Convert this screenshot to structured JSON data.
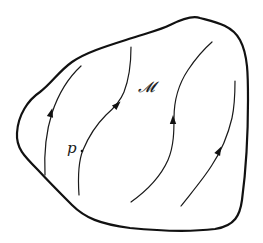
{
  "diagram": {
    "manifold_label": "𝓜",
    "point_label": "p",
    "colors": {
      "stroke": "#111111",
      "background": "#ffffff"
    },
    "outline": {
      "name": "manifold-boundary",
      "path": "M17,133 C18,115 28,100 40,92 C52,83 58,72 72,62 C86,52 110,45 132,38 C150,32 160,30 170,25 C180,20 192,15 200,18 C215,22 232,25 240,40 C248,55 248,75 248,100 C248,140 246,170 242,200 C240,215 235,226 215,229 C190,232 160,231 130,228 C100,224 85,218 72,205 C58,191 50,183 38,170 C24,156 16,148 17,133 Z"
    },
    "flow_curves": [
      {
        "name": "flow-curve-1",
        "path": "M45,175 C44,155 45,135 52,113 C58,95 68,78 81,66",
        "arrow": {
          "x": 51,
          "y": 113,
          "angle": -75
        }
      },
      {
        "name": "flow-curve-2",
        "path": "M79,195 C78,180 78,162 83,150 C88,138 96,125 106,115 C114,108 120,102 124,92 C129,79 131,62 131,47",
        "arrow": {
          "x": 117,
          "y": 105,
          "angle": -45
        },
        "point": {
          "x": 82,
          "y": 151
        }
      },
      {
        "name": "flow-curve-3",
        "path": "M131,202 C145,192 160,178 168,160 C174,146 174,130 174,118 C174,100 178,85 188,70 C196,58 204,49 212,42",
        "arrow": {
          "x": 173,
          "y": 120,
          "angle": -90
        }
      },
      {
        "name": "flow-curve-4",
        "path": "M181,206 C192,192 204,178 212,165 C222,150 228,135 232,118 C235,104 235,92 235,81",
        "arrow": {
          "x": 219,
          "y": 151,
          "angle": -63
        }
      }
    ]
  }
}
